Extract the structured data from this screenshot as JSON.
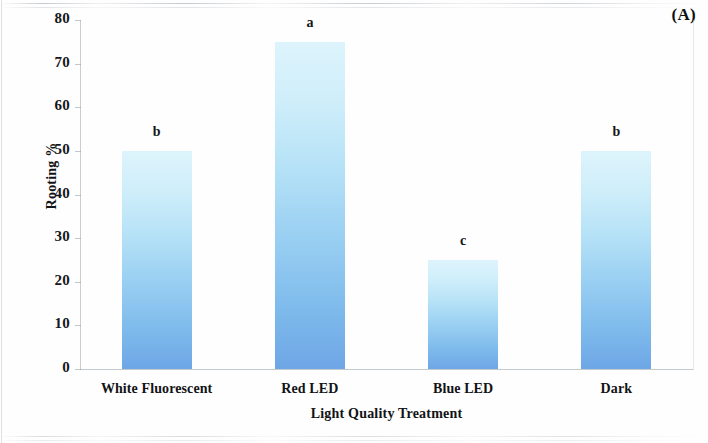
{
  "panel": {
    "label": "(A)"
  },
  "chart_data": {
    "type": "bar",
    "title": "",
    "subtitle": "",
    "xlabel": "Light Quality Treatment",
    "ylabel": "Rooting %",
    "categories": [
      "White Fluorescent",
      "Red LED",
      "Blue LED",
      "Dark"
    ],
    "values": [
      50,
      75,
      25,
      50
    ],
    "annotations": [
      "b",
      "a",
      "c",
      "b"
    ],
    "annotation_note": "letters denote statistical significance groupings",
    "ylim": [
      0,
      80
    ],
    "yticks": [
      0,
      10,
      20,
      30,
      40,
      50,
      60,
      70,
      80
    ],
    "ytick_labels": [
      "0",
      "10",
      "20",
      "30",
      "40",
      "50",
      "60",
      "70",
      "80"
    ],
    "grid": false,
    "legend": false,
    "legend_position": "none",
    "bar_color_top": "#ddf4fc",
    "bar_color_bottom": "#6ea6e6",
    "axis_color": "#96a0a8",
    "text_color": "#121316"
  }
}
